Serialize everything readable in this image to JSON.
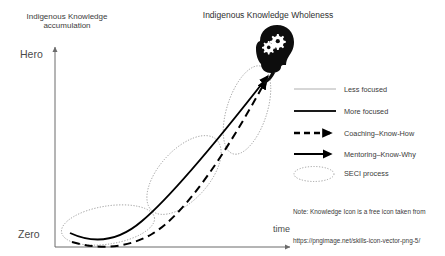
{
  "diagram": {
    "apex_title": "Indigenous Knowledge Wholeness",
    "y_axis_title": "Indigenous Knowledge\naccumulation",
    "y_axis_top_label": "Hero",
    "y_axis_bottom_label": "Zero",
    "x_axis_label": "time",
    "apex_icon": "head-with-gears-icon",
    "colors": {
      "axis": "#6b6b6b",
      "curve_solid": "#000000",
      "curve_dashed": "#000000",
      "ellipse_dotted": "#8a8a8a",
      "legend_less_focused": "#9a9a9a",
      "text": "#3a3a3a"
    },
    "seci_ellipses": [
      {
        "name": "seci-ellipse-lower"
      },
      {
        "name": "seci-ellipse-middle"
      },
      {
        "name": "seci-ellipse-upper"
      }
    ],
    "curves": [
      {
        "name": "more-focused-curve",
        "style": "solid"
      },
      {
        "name": "coaching-know-how-curve",
        "style": "dashed"
      }
    ]
  },
  "legend": {
    "items": [
      {
        "label": "Less focused",
        "swatch": "thin-line",
        "icon": "line-icon"
      },
      {
        "label": "More focused",
        "swatch": "thick-line",
        "icon": "line-icon"
      },
      {
        "label": "Coaching–Know-How",
        "swatch": "dashed-arrow",
        "icon": "dashed-arrow-icon"
      },
      {
        "label": "Mentoring–Know-Why",
        "swatch": "solid-arrow",
        "icon": "solid-arrow-icon"
      },
      {
        "label": "SECI process",
        "swatch": "dotted-ellipse",
        "icon": "ellipse-icon"
      }
    ]
  },
  "note": {
    "line1": "Note: Knowledge Icon is a free icon taken from",
    "line2": "https://pngimage.net/skills-icon-vector-png-5/"
  }
}
